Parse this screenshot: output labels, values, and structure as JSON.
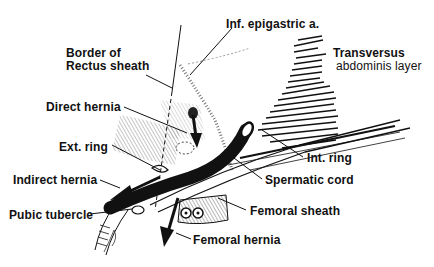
{
  "figure": {
    "colors": {
      "ink": "#111111",
      "background": "#ffffff"
    },
    "labels": {
      "inf_epigastric": "Inf. epigastric a.",
      "border_line1": "Border of",
      "border_line2": "Rectus sheath",
      "transversus_line1": "Transversus",
      "transversus_line2": "abdominis layer",
      "direct_hernia": "Direct hernia",
      "ext_ring": "Ext. ring",
      "indirect_hernia": "Indirect hernia",
      "int_ring": "Int. ring",
      "spermatic_cord": "Spermatic cord",
      "pubic_tubercle": "Pubic tubercle",
      "femoral_sheath": "Femoral sheath",
      "femoral_hernia": "Femoral hernia"
    }
  }
}
